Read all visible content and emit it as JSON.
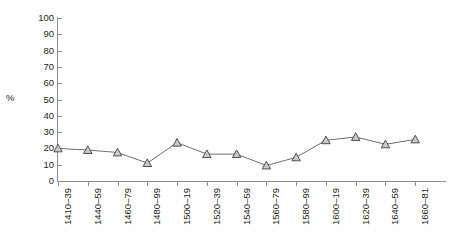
{
  "chart_data": {
    "type": "line",
    "title": "",
    "xlabel": "",
    "ylabel": "%",
    "ylim": [
      0,
      100
    ],
    "yticks": [
      0,
      10,
      20,
      30,
      40,
      50,
      60,
      70,
      80,
      90,
      100
    ],
    "grid": false,
    "legend": "none",
    "marker": "triangle",
    "categories": [
      "1410–39",
      "1440–59",
      "1460–79",
      "1480–99",
      "1500–19",
      "1520–39",
      "1540–59",
      "1560–79",
      "1580–99",
      "1600–19",
      "1620–39",
      "1640–59",
      "1660–81"
    ],
    "values": [
      20,
      19,
      17.5,
      11,
      23.5,
      16.5,
      16.5,
      9.5,
      14.5,
      25,
      27,
      22.5,
      25.5
    ],
    "line_color": "#6d6d6d",
    "marker_fill": "#c9c9c9",
    "marker_stroke": "#3f3f3f",
    "axis_color": "#8d8d8d",
    "text_color": "#231f20"
  }
}
